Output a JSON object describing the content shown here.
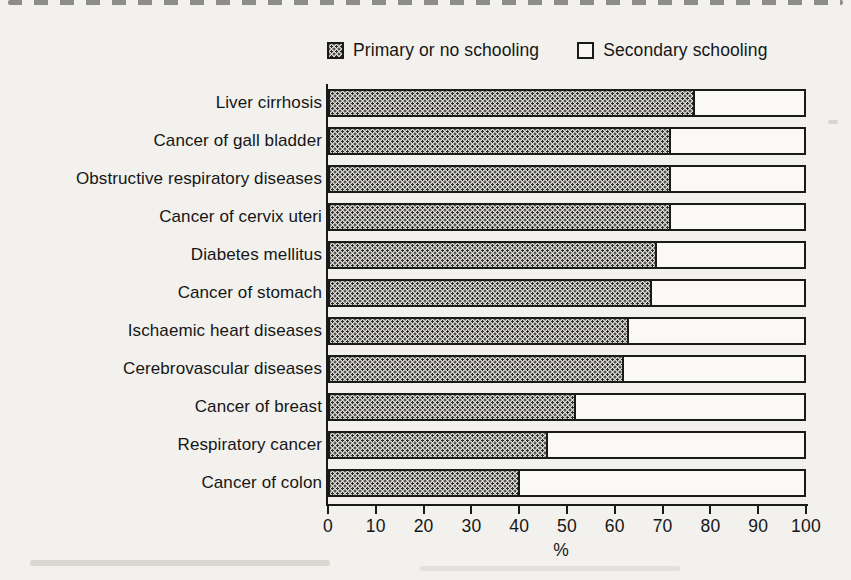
{
  "legend": {
    "primary_label": "Primary or no schooling",
    "secondary_label": "Secondary schooling"
  },
  "chart_data": {
    "type": "bar",
    "orientation": "horizontal",
    "stacked": true,
    "categories": [
      "Liver cirrhosis",
      "Cancer of gall bladder",
      "Obstructive respiratory diseases",
      "Cancer of cervix uteri",
      "Diabetes mellitus",
      "Cancer of stomach",
      "Ischaemic heart diseases",
      "Cerebrovascular diseases",
      "Cancer of breast",
      "Respiratory cancer",
      "Cancer of colon"
    ],
    "series": [
      {
        "name": "Primary or no schooling",
        "values": [
          77,
          72,
          72,
          72,
          69,
          68,
          63,
          62,
          52,
          46,
          40
        ]
      },
      {
        "name": "Secondary schooling",
        "values": [
          23,
          28,
          28,
          28,
          31,
          32,
          37,
          38,
          48,
          54,
          60
        ]
      }
    ],
    "xlabel": "%",
    "xlim": [
      0,
      100
    ],
    "xticks": [
      0,
      10,
      20,
      30,
      40,
      50,
      60,
      70,
      80,
      90,
      100
    ],
    "legend_position": "top",
    "grid": false,
    "pattern_primary": "dotted-halftone",
    "colors": {
      "primary_fill": "#dbd9d3",
      "primary_dot": "#2b2b2b",
      "secondary_fill": "#faf9f6",
      "outline": "#1a1a1a"
    }
  }
}
